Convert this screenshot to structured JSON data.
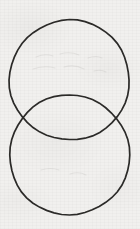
{
  "figure": {
    "canvas": {
      "width": 140,
      "height": 229,
      "background_color": "#f1f0ee",
      "medium": "scanned paper"
    },
    "stroke": {
      "color": "#2b2a28",
      "width": 1.7,
      "style": "hand-drawn outline"
    },
    "shapes": [
      {
        "name": "upper-circle",
        "type": "circle",
        "center_x": 69.5,
        "center_y": 80,
        "radius": 60,
        "fill": "none"
      },
      {
        "name": "lower-circle",
        "type": "circle",
        "center_x": 69.5,
        "center_y": 155,
        "radius": 60,
        "fill": "none"
      }
    ],
    "intersections": [
      {
        "name": "left-intersection",
        "x": 18,
        "y": 118
      },
      {
        "name": "right-intersection",
        "x": 121,
        "y": 118
      }
    ],
    "overlap_region": {
      "name": "lens",
      "shape": "vesica",
      "fill": "none",
      "center_y": 118
    }
  }
}
